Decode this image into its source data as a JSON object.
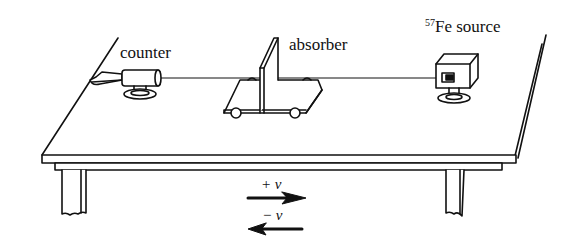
{
  "diagram": {
    "labels": {
      "counter": "counter",
      "absorber": "absorber",
      "source_isotope_mass": "57",
      "source_element": "Fe",
      "source_word": "source",
      "plus_v": "+ v",
      "minus_v": "− v"
    },
    "components": [
      "counter",
      "absorber (on wheeled cart)",
      "57Fe source",
      "table"
    ],
    "arrows": [
      {
        "label": "+ v",
        "direction": "right"
      },
      {
        "label": "− v",
        "direction": "left"
      }
    ],
    "stroke_color": "#111111",
    "background": "#ffffff"
  }
}
